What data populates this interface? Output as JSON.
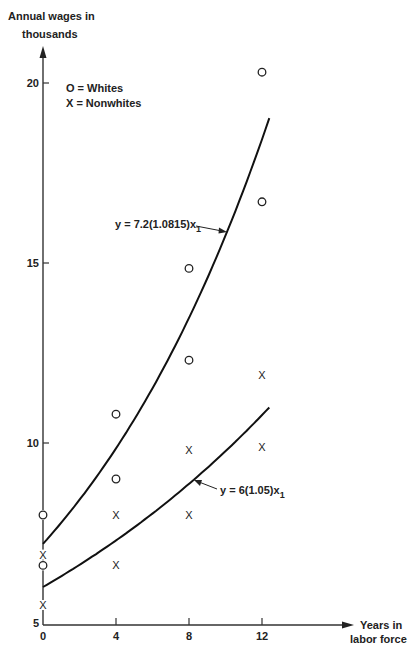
{
  "chart_data": {
    "type": "scatter",
    "title": "",
    "xlabel": "Years in labor force",
    "ylabel": "Annual wages in thousands",
    "xlabel_lines": [
      "Years in",
      "labor force"
    ],
    "ylabel_lines": [
      "Annual wages in",
      "thousands"
    ],
    "xlim": [
      0,
      20
    ],
    "ylim": [
      5,
      21
    ],
    "x_ticks": [
      0,
      4,
      8,
      12
    ],
    "y_ticks": [
      5,
      10,
      15,
      20
    ],
    "grid": false,
    "legend": {
      "position": "upper-left",
      "entries": [
        {
          "marker": "O",
          "label": "= Whites"
        },
        {
          "marker": "X",
          "label": "= Nonwhites"
        }
      ]
    },
    "series": [
      {
        "name": "Whites",
        "marker": "circle",
        "points": [
          {
            "x": 0,
            "y": 8.0
          },
          {
            "x": 0,
            "y": 6.6
          },
          {
            "x": 4,
            "y": 10.8
          },
          {
            "x": 4,
            "y": 9.0
          },
          {
            "x": 8,
            "y": 14.85
          },
          {
            "x": 8,
            "y": 12.3
          },
          {
            "x": 12,
            "y": 20.3
          },
          {
            "x": 12,
            "y": 16.7
          }
        ]
      },
      {
        "name": "Nonwhites",
        "marker": "x",
        "points": [
          {
            "x": 0,
            "y": 6.9
          },
          {
            "x": 0,
            "y": 5.5
          },
          {
            "x": 4,
            "y": 8.0
          },
          {
            "x": 4,
            "y": 6.6
          },
          {
            "x": 8,
            "y": 9.8
          },
          {
            "x": 8,
            "y": 8.0
          },
          {
            "x": 12,
            "y": 11.9
          },
          {
            "x": 12,
            "y": 9.9
          }
        ]
      }
    ],
    "curves": [
      {
        "name": "Whites fit",
        "equation": "y = 7.2(1.0815)x₁",
        "a": 7.2,
        "b": 1.0815,
        "x_range": [
          0,
          12.4
        ]
      },
      {
        "name": "Nonwhites fit",
        "equation": "y = 6(1.05)x₁",
        "a": 6,
        "b": 1.05,
        "x_range": [
          0,
          12.4
        ]
      }
    ],
    "annotations": [
      {
        "text": "y = 7.2(1.0815)x₁",
        "points_to": "Whites fit"
      },
      {
        "text": "y = 6(1.05)x₁",
        "points_to": "Nonwhites fit"
      }
    ]
  },
  "labels": {
    "y_axis_line1": "Annual wages in",
    "y_axis_line2": "thousands",
    "x_axis_line1": "Years in",
    "x_axis_line2": "labor force",
    "legend_whites": "O = Whites",
    "legend_nonwhites": "X = Nonwhites",
    "eq_whites_main": "y = 7.2(1.0815)x",
    "eq_whites_sub": "1",
    "eq_nonwhites_main": "y = 6(1.05)x",
    "eq_nonwhites_sub": "1"
  }
}
